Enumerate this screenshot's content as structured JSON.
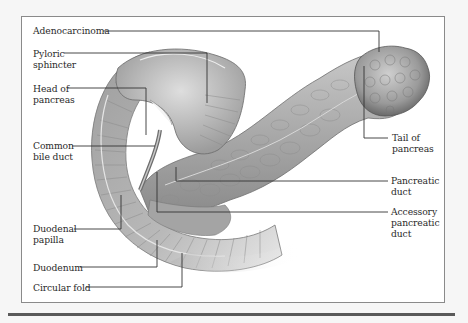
{
  "figure": {
    "colors": {
      "page_background": "#f6f6f6",
      "frame_fill": "#ffffff",
      "frame_border": "#8a8a8a",
      "bottom_rule": "#5a5a5a",
      "leader_line": "#333333",
      "label_text": "#2a2a2a",
      "tissue_light": "#d2d2d2",
      "tissue_mid": "#a8a8a8",
      "tissue_dark": "#6e6e6e"
    },
    "labels": {
      "adenocarcinoma": "Adenocarcinoma",
      "pyloric_sphincter": "Pyloric\nsphincter",
      "head_of_pancreas": "Head of\npancreas",
      "common_bile_duct": "Common\nbile duct",
      "duodenal_papilla": "Duodenal\npapilla",
      "duodenum": "Duodenum",
      "circular_fold": "Circular fold",
      "tail_of_pancreas": "Tail of\npancreas",
      "pancreatic_duct": "Pancreatic\nduct",
      "accessory_pancreatic_duct": "Accessory\npancreatic\nduct"
    }
  }
}
